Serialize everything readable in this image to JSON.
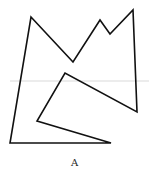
{
  "figure": {
    "caption": "A",
    "shape": "polygon",
    "stroke_color": "#111111",
    "stroke_width": 1.6,
    "fill": "none",
    "vertices": [
      [
        31,
        17
      ],
      [
        73,
        62
      ],
      [
        100,
        20
      ],
      [
        110,
        34
      ],
      [
        133,
        10
      ],
      [
        137,
        112
      ],
      [
        65,
        73
      ],
      [
        37,
        121
      ],
      [
        111,
        143
      ],
      [
        10,
        143
      ]
    ],
    "guide_line": {
      "y": 81,
      "color": "#e6e6e6"
    }
  }
}
